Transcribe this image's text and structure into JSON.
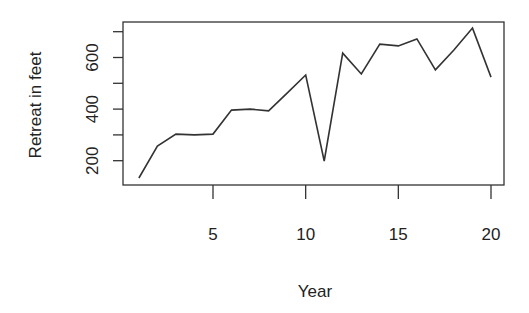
{
  "chart_data": {
    "type": "line",
    "title": "",
    "xlabel": "Year",
    "ylabel": "Retreat in feet",
    "x": [
      1,
      2,
      3,
      4,
      5,
      6,
      7,
      8,
      9,
      10,
      11,
      12,
      13,
      14,
      15,
      16,
      17,
      18,
      19,
      20
    ],
    "series": [
      {
        "name": "Retreat",
        "values": [
          133,
          257,
          303,
          300,
          303,
          396,
          400,
          393,
          462,
          532,
          199,
          617,
          536,
          652,
          645,
          672,
          552,
          629,
          714,
          524
        ]
      }
    ],
    "xticks": [
      5,
      10,
      15,
      20
    ],
    "xtick_labels": [
      "5",
      "10",
      "15",
      "20"
    ],
    "yticks": [
      200,
      300,
      400,
      500,
      600,
      700
    ],
    "ytick_labels": [
      "200",
      "",
      "400",
      "",
      "600",
      ""
    ],
    "xlim": [
      0.28,
      20.72
    ],
    "ylim": [
      112,
      735
    ],
    "grid": false,
    "legend": null,
    "line_color": "#333333"
  }
}
